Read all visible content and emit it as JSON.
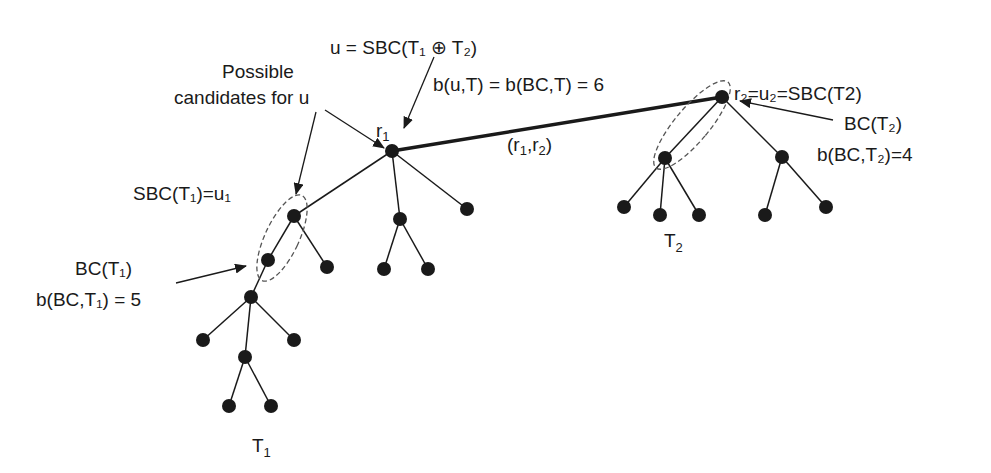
{
  "diagram": {
    "labels": {
      "u_def": "u = SBC(T₁ ⊕ T₂)",
      "possible_line1": "Possible",
      "possible_line2": "candidates for u",
      "b_u": "b(u,T) = b(BC,T) = 6",
      "r1": "r",
      "r1_sub": "1",
      "edge_r1r2": "(r",
      "edge_sub1": "1",
      "edge_mid": ",r",
      "edge_sub2": "2",
      "edge_close": ")",
      "r2_def": "r₂=u₂=SBC(T2)",
      "bc_t2": "BC(T₂)",
      "b_bc_t2": "b(BC,T₂)=4",
      "sbc_t1": "SBC(T₁)=u₁",
      "bc_t1": "BC(T₁)",
      "b_bc_t1": "b(BC,T₁) = 5",
      "t1": "T",
      "t1_sub": "1",
      "t2": "T",
      "t2_sub": "2"
    },
    "colors": {
      "ink": "#1a1a1a",
      "dashed": "#555555"
    }
  }
}
